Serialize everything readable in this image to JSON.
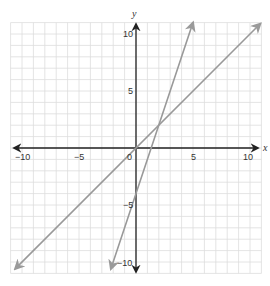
{
  "chart_data": {
    "type": "line",
    "title": "",
    "xlabel": "x",
    "ylabel": "y",
    "xlim": [
      -10,
      10
    ],
    "ylim": [
      -10,
      10
    ],
    "grid": true,
    "grid_step": 1,
    "x_ticks": [
      -10,
      -5,
      0,
      5,
      10
    ],
    "y_ticks": [
      -10,
      -5,
      5,
      10
    ],
    "x_tick_labels": [
      "−10",
      "−5",
      "0",
      "5",
      "10"
    ],
    "y_tick_labels": [
      "−10",
      "−5",
      "5",
      "10"
    ],
    "origin_label": "0",
    "series": [
      {
        "name": "line-1",
        "equation": "y = x",
        "slope": 1,
        "intercept": 0,
        "x": [
          -10.6,
          10.9
        ],
        "y": [
          -10.6,
          10.9
        ],
        "color": "#999999",
        "arrows": "both"
      },
      {
        "name": "line-2",
        "equation": "y = 3x - 4",
        "slope": 3,
        "intercept": -4,
        "x": [
          -2.2,
          5.0
        ],
        "y": [
          -10.6,
          11.0
        ],
        "color": "#999999",
        "arrows": "both"
      }
    ],
    "intersection": {
      "x": 2,
      "y": 2
    }
  },
  "labels": {
    "x_axis": "x",
    "y_axis": "y",
    "origin": "0",
    "x_ticks": [
      "−10",
      "−5",
      "5",
      "10"
    ],
    "y_ticks": [
      "10",
      "5",
      "−5",
      "−10"
    ]
  },
  "colors": {
    "grid": "#dddddd",
    "axis": "#222222",
    "line": "#9a9a9a"
  }
}
